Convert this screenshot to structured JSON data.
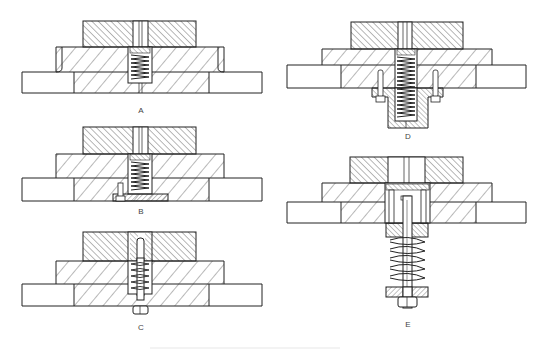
{
  "figure": {
    "line_color": "#222222",
    "background": "#ffffff",
    "panels": [
      {
        "id": "A",
        "label": "A",
        "variant": "internal-spring-in-stripper",
        "label_pos": [
          141,
          111
        ]
      },
      {
        "id": "B",
        "label": "B",
        "variant": "internal-spring-with-retaining-plate",
        "label_pos": [
          141,
          212
        ]
      },
      {
        "id": "C",
        "label": "C",
        "variant": "spring-on-shoulder-bolt",
        "label_pos": [
          141,
          328
        ]
      },
      {
        "id": "D",
        "label": "D",
        "variant": "spring-in-external-cup",
        "label_pos": [
          408,
          137
        ]
      },
      {
        "id": "E",
        "label": "E",
        "variant": "external-spring-on-bolt",
        "label_pos": [
          408,
          325
        ]
      }
    ]
  }
}
